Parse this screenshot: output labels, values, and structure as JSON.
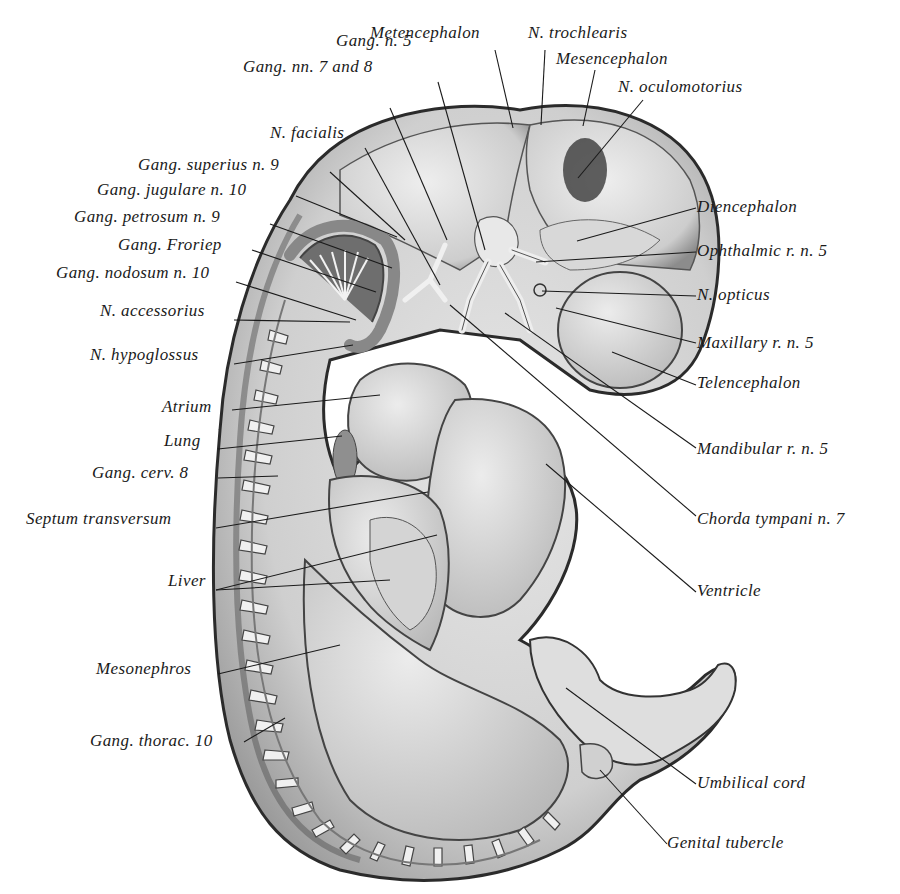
{
  "figure": {
    "labels": [
      {
        "id": "metencephalon",
        "text": "Metencephalon",
        "x": 370,
        "y": 24,
        "align": "left",
        "lx1": 495,
        "ly1": 50,
        "lx2": 513,
        "ly2": 128
      },
      {
        "id": "n-trochlearis",
        "text": "N. trochlearis",
        "x": 528,
        "y": 24,
        "align": "left",
        "lx1": 545,
        "ly1": 50,
        "lx2": 541,
        "ly2": 125
      },
      {
        "id": "mesencephalon",
        "text": "Mesencephalon",
        "x": 556,
        "y": 50,
        "align": "left",
        "lx1": 595,
        "ly1": 70,
        "lx2": 583,
        "ly2": 126
      },
      {
        "id": "n-oculomotorius",
        "text": "N. oculomotorius",
        "x": 618,
        "y": 78,
        "align": "left",
        "lx1": 643,
        "ly1": 100,
        "lx2": 578,
        "ly2": 178
      },
      {
        "id": "gang-n-5",
        "text": "Gang. n. 5",
        "x": 336,
        "y": 32,
        "align": "left",
        "lx1": 438,
        "ly1": 82,
        "lx2": 485,
        "ly2": 250
      },
      {
        "id": "gang-nn-7-8",
        "text": "Gang. nn. 7 and 8",
        "x": 243,
        "y": 58,
        "align": "left",
        "lx1": 390,
        "ly1": 108,
        "lx2": 447,
        "ly2": 240
      },
      {
        "id": "n-facialis",
        "text": "N. facialis",
        "x": 270,
        "y": 124,
        "align": "left",
        "lx1": 365,
        "ly1": 148,
        "lx2": 440,
        "ly2": 285
      },
      {
        "id": "gang-superius-n-9",
        "text": "Gang. superius n. 9",
        "x": 138,
        "y": 156,
        "align": "left",
        "lx1": 330,
        "ly1": 172,
        "lx2": 405,
        "ly2": 240
      },
      {
        "id": "gang-jugulare-n-10",
        "text": "Gang. jugulare n. 10",
        "x": 97,
        "y": 181,
        "align": "left",
        "lx1": 296,
        "ly1": 196,
        "lx2": 397,
        "ly2": 237
      },
      {
        "id": "gang-petrosum-n-9",
        "text": "Gang. petrosum n. 9",
        "x": 74,
        "y": 208,
        "align": "left",
        "lx1": 270,
        "ly1": 224,
        "lx2": 392,
        "ly2": 268
      },
      {
        "id": "gang-froriep",
        "text": "Gang. Froriep",
        "x": 118,
        "y": 236,
        "align": "left",
        "lx1": 252,
        "ly1": 250,
        "lx2": 376,
        "ly2": 292
      },
      {
        "id": "gang-nodosum-n-10",
        "text": "Gang. nodosum n. 10",
        "x": 56,
        "y": 264,
        "align": "left",
        "lx1": 236,
        "ly1": 282,
        "lx2": 356,
        "ly2": 320
      },
      {
        "id": "n-accessorius",
        "text": "N. accessorius",
        "x": 100,
        "y": 302,
        "align": "left",
        "lx1": 234,
        "ly1": 320,
        "lx2": 350,
        "ly2": 322
      },
      {
        "id": "n-hypoglossus",
        "text": "N. hypoglossus",
        "x": 90,
        "y": 346,
        "align": "left",
        "lx1": 234,
        "ly1": 364,
        "lx2": 353,
        "ly2": 345
      },
      {
        "id": "atrium",
        "text": "Atrium",
        "x": 162,
        "y": 398,
        "align": "left",
        "lx1": 232,
        "ly1": 410,
        "lx2": 380,
        "ly2": 395
      },
      {
        "id": "lung",
        "text": "Lung",
        "x": 164,
        "y": 432,
        "align": "left",
        "lx1": 218,
        "ly1": 449,
        "lx2": 342,
        "ly2": 436
      },
      {
        "id": "gang-cerv-8",
        "text": "Gang. cerv. 8",
        "x": 92,
        "y": 464,
        "align": "left",
        "lx1": 218,
        "ly1": 478,
        "lx2": 278,
        "ly2": 476
      },
      {
        "id": "septum-transversum",
        "text": "Septum transversum",
        "x": 26,
        "y": 510,
        "align": "left",
        "lx1": 216,
        "ly1": 528,
        "lx2": 428,
        "ly2": 492
      },
      {
        "id": "liver",
        "text": "Liver",
        "x": 168,
        "y": 572,
        "align": "left",
        "lx1": 216,
        "ly1": 590,
        "lx2": 437,
        "ly2": 535
      },
      {
        "id": "liver-b",
        "text": "",
        "x": 0,
        "y": 0,
        "align": "left",
        "lx1": 216,
        "ly1": 590,
        "lx2": 390,
        "ly2": 580
      },
      {
        "id": "mesonephros",
        "text": "Mesonephros",
        "x": 96,
        "y": 660,
        "align": "left",
        "lx1": 218,
        "ly1": 674,
        "lx2": 340,
        "ly2": 645
      },
      {
        "id": "gang-thorac-10",
        "text": "Gang. thorac. 10",
        "x": 90,
        "y": 732,
        "align": "left",
        "lx1": 244,
        "ly1": 742,
        "lx2": 285,
        "ly2": 718
      },
      {
        "id": "diencephalon",
        "text": "Diencephalon",
        "x": 697,
        "y": 198,
        "align": "left",
        "lx1": 696,
        "ly1": 208,
        "lx2": 577,
        "ly2": 241
      },
      {
        "id": "ophthalmic-r-n-5",
        "text": "Ophthalmic r. n. 5",
        "x": 697,
        "y": 242,
        "align": "left",
        "lx1": 696,
        "ly1": 252,
        "lx2": 536,
        "ly2": 262
      },
      {
        "id": "n-opticus",
        "text": "N. opticus",
        "x": 697,
        "y": 286,
        "align": "left",
        "lx1": 696,
        "ly1": 296,
        "lx2": 542,
        "ly2": 291
      },
      {
        "id": "maxillary-r-n-5",
        "text": "Maxillary r. n. 5",
        "x": 697,
        "y": 334,
        "align": "left",
        "lx1": 696,
        "ly1": 343,
        "lx2": 556,
        "ly2": 308
      },
      {
        "id": "telencephalon",
        "text": "Telencephalon",
        "x": 697,
        "y": 374,
        "align": "left",
        "lx1": 696,
        "ly1": 385,
        "lx2": 612,
        "ly2": 352
      },
      {
        "id": "mandibular-r-n-5",
        "text": "Mandibular r. n. 5",
        "x": 697,
        "y": 440,
        "align": "left",
        "lx1": 696,
        "ly1": 448,
        "lx2": 505,
        "ly2": 313
      },
      {
        "id": "chorda-tympani-n-7",
        "text": "Chorda tympani n. 7",
        "x": 697,
        "y": 510,
        "align": "left",
        "lx1": 696,
        "ly1": 516,
        "lx2": 450,
        "ly2": 305
      },
      {
        "id": "ventricle",
        "text": "Ventricle",
        "x": 697,
        "y": 582,
        "align": "left",
        "lx1": 696,
        "ly1": 592,
        "lx2": 546,
        "ly2": 464
      },
      {
        "id": "umbilical-cord",
        "text": "Umbilical cord",
        "x": 697,
        "y": 774,
        "align": "left",
        "lx1": 696,
        "ly1": 784,
        "lx2": 566,
        "ly2": 688
      },
      {
        "id": "genital-tubercle",
        "text": "Genital tubercle",
        "x": 667,
        "y": 834,
        "align": "left",
        "lx1": 667,
        "ly1": 844,
        "lx2": 600,
        "ly2": 770
      }
    ]
  },
  "colors": {
    "ink": "#1a1a1a",
    "body_fill": "#d9d9d9",
    "organ_fill": "#cfcfcf",
    "light_fill": "#ebebeb",
    "dark_fill": "#7a7a7a",
    "outline": "#333333"
  }
}
